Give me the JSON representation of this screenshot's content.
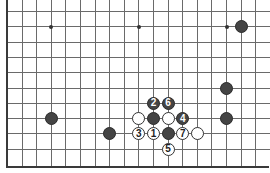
{
  "board": {
    "grid": {
      "origin_x": 7,
      "origin_y": 11,
      "spacing_x": 14.6,
      "spacing_y": 15.3,
      "columns": 19,
      "rows": 11,
      "line_color": "#6a6a6a"
    },
    "star_points": [
      {
        "col": 3,
        "row": 1
      },
      {
        "col": 9,
        "row": 1
      },
      {
        "col": 15,
        "row": 1
      }
    ],
    "stones": [
      {
        "color": "black",
        "col": 16,
        "row": 1,
        "label": ""
      },
      {
        "color": "black",
        "col": 15,
        "row": 5,
        "label": ""
      },
      {
        "color": "black",
        "col": 15,
        "row": 7,
        "label": ""
      },
      {
        "color": "black",
        "col": 3,
        "row": 7,
        "label": ""
      },
      {
        "color": "black",
        "col": 7,
        "row": 8,
        "label": ""
      },
      {
        "color": "black",
        "col": 10,
        "row": 6,
        "label": "2"
      },
      {
        "color": "black",
        "col": 11,
        "row": 6,
        "label": "6"
      },
      {
        "color": "white",
        "col": 9,
        "row": 7,
        "label": ""
      },
      {
        "color": "black",
        "col": 10,
        "row": 7,
        "label": ""
      },
      {
        "color": "white",
        "col": 11,
        "row": 7,
        "label": ""
      },
      {
        "color": "black",
        "col": 12,
        "row": 7,
        "label": "4"
      },
      {
        "color": "white",
        "col": 9,
        "row": 8,
        "label": "3"
      },
      {
        "color": "white",
        "col": 10,
        "row": 8,
        "label": "1"
      },
      {
        "color": "black",
        "col": 11,
        "row": 8,
        "label": ""
      },
      {
        "color": "white",
        "col": 12,
        "row": 8,
        "label": "7"
      },
      {
        "color": "white",
        "col": 13,
        "row": 8,
        "label": ""
      },
      {
        "color": "white",
        "col": 11,
        "row": 9,
        "label": "5"
      }
    ]
  }
}
